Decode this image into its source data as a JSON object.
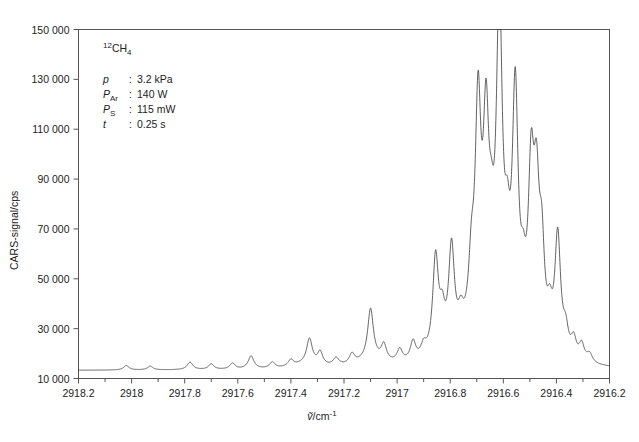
{
  "chart_data": {
    "type": "line",
    "title": "",
    "xlabel": "ṽ/cm⁻¹",
    "ylabel": "CARS-signal/cps",
    "xlim": [
      2918.2,
      2916.2
    ],
    "ylim": [
      10000,
      150000
    ],
    "x_inverted": true,
    "grid": false,
    "legend": null,
    "x_ticks": [
      "2918.2",
      "2918",
      "2917.8",
      "2917.6",
      "2917.4",
      "2917.2",
      "2917",
      "2916.8",
      "2916.6",
      "2916.4",
      "2916.2"
    ],
    "x_tick_values": [
      2918.2,
      2918.0,
      2917.8,
      2917.6,
      2917.4,
      2917.2,
      2917.0,
      2916.8,
      2916.6,
      2916.4,
      2916.2
    ],
    "x_minor_step": 0.1,
    "y_ticks": [
      "150 000",
      "130 000",
      "110 000",
      "90 000",
      "70 000",
      "50 000",
      "30 000",
      "10 000"
    ],
    "y_tick_values": [
      150000,
      130000,
      110000,
      90000,
      70000,
      50000,
      30000,
      10000
    ],
    "baseline": 13200,
    "series": [
      {
        "name": "12CH4 CARS spectrum",
        "color": "#3a3a3a",
        "peaks": [
          {
            "x": 2918.02,
            "height": 1800,
            "width": 0.012
          },
          {
            "x": 2917.93,
            "height": 1500,
            "width": 0.012
          },
          {
            "x": 2917.78,
            "height": 3000,
            "width": 0.013
          },
          {
            "x": 2917.7,
            "height": 2200,
            "width": 0.012
          },
          {
            "x": 2917.62,
            "height": 2400,
            "width": 0.012
          },
          {
            "x": 2917.55,
            "height": 5200,
            "width": 0.013
          },
          {
            "x": 2917.47,
            "height": 2400,
            "width": 0.012
          },
          {
            "x": 2917.4,
            "height": 2600,
            "width": 0.012
          },
          {
            "x": 2917.33,
            "height": 10200,
            "width": 0.013
          },
          {
            "x": 2917.29,
            "height": 5200,
            "width": 0.012
          },
          {
            "x": 2917.23,
            "height": 3000,
            "width": 0.013
          },
          {
            "x": 2917.17,
            "height": 4000,
            "width": 0.012
          },
          {
            "x": 2917.1,
            "height": 20500,
            "width": 0.013
          },
          {
            "x": 2917.05,
            "height": 6500,
            "width": 0.012
          },
          {
            "x": 2916.99,
            "height": 5000,
            "width": 0.012
          },
          {
            "x": 2916.94,
            "height": 7500,
            "width": 0.012
          },
          {
            "x": 2916.9,
            "height": 4500,
            "width": 0.012
          },
          {
            "x": 2916.855,
            "height": 38500,
            "width": 0.013
          },
          {
            "x": 2916.83,
            "height": 12500,
            "width": 0.012
          },
          {
            "x": 2916.795,
            "height": 39500,
            "width": 0.013
          },
          {
            "x": 2916.76,
            "height": 8000,
            "width": 0.012
          },
          {
            "x": 2916.72,
            "height": 22000,
            "width": 0.012
          },
          {
            "x": 2916.695,
            "height": 85000,
            "width": 0.013
          },
          {
            "x": 2916.665,
            "height": 73500,
            "width": 0.013
          },
          {
            "x": 2916.645,
            "height": 21000,
            "width": 0.012
          },
          {
            "x": 2916.615,
            "height": 127000,
            "width": 0.013
          },
          {
            "x": 2916.585,
            "height": 25000,
            "width": 0.012
          },
          {
            "x": 2916.555,
            "height": 95000,
            "width": 0.013
          },
          {
            "x": 2916.525,
            "height": 16000,
            "width": 0.012
          },
          {
            "x": 2916.495,
            "height": 63000,
            "width": 0.013
          },
          {
            "x": 2916.475,
            "height": 54000,
            "width": 0.013
          },
          {
            "x": 2916.455,
            "height": 34000,
            "width": 0.012
          },
          {
            "x": 2916.425,
            "height": 12000,
            "width": 0.012
          },
          {
            "x": 2916.395,
            "height": 47000,
            "width": 0.013
          },
          {
            "x": 2916.365,
            "height": 9000,
            "width": 0.012
          },
          {
            "x": 2916.335,
            "height": 7500,
            "width": 0.012
          },
          {
            "x": 2916.305,
            "height": 6500,
            "width": 0.012
          },
          {
            "x": 2916.275,
            "height": 3500,
            "width": 0.013
          }
        ],
        "broad_background": [
          {
            "x": 2916.7,
            "height": 9000,
            "width": 0.09
          },
          {
            "x": 2916.6,
            "height": 7000,
            "width": 0.08
          },
          {
            "x": 2917.1,
            "height": 2500,
            "width": 0.07
          },
          {
            "x": 2917.35,
            "height": 1600,
            "width": 0.06
          }
        ]
      }
    ],
    "annotations": {
      "molecule": "¹²CH₄",
      "parameters": [
        {
          "symbol": "p",
          "sep": ":",
          "value": "3.2 kPa"
        },
        {
          "symbol": "P",
          "sub": "Ar",
          "sep": ":",
          "value": "140 W"
        },
        {
          "symbol": "P",
          "sub": "S",
          "sep": ":",
          "value": "115 mW"
        },
        {
          "symbol": "t",
          "sep": ":",
          "value": "0.25 s"
        }
      ]
    },
    "colors": {
      "background": "#ffffff",
      "line": "#3a3a3a",
      "axis": "#555555",
      "text": "#222222"
    }
  }
}
